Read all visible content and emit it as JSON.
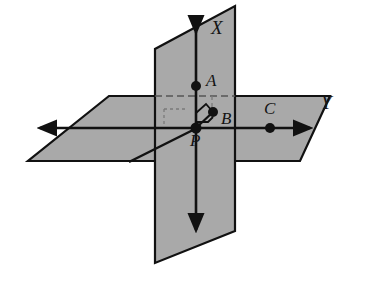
{
  "figure": {
    "background_color": "#ffffff",
    "plane_fill_color": "#a9a9a9",
    "plane_stroke_color": "#111111",
    "axis_color": "#111111",
    "point_color": "#111111",
    "dashed_color": "#6e6e6e"
  },
  "axes": [
    {
      "name": "x-axis",
      "label": "X",
      "orientation": "vertical",
      "label_position": {
        "x": 211,
        "y": 20
      },
      "arrow_start": {
        "x": 196,
        "y": 30
      },
      "arrow_end": {
        "x": 196,
        "y": 232
      },
      "double_headed": true
    },
    {
      "name": "y-axis",
      "label": "Y",
      "orientation": "horizontal",
      "label_position": {
        "x": 322,
        "y": 94
      },
      "arrow_start": {
        "x": 38,
        "y": 128
      },
      "arrow_end": {
        "x": 312,
        "y": 128
      },
      "double_headed": true
    }
  ],
  "points": [
    {
      "name": "point-a",
      "label": "A",
      "x": 196,
      "y": 86,
      "label_x": 205,
      "label_y": 74,
      "radius": 5
    },
    {
      "name": "point-b",
      "label": "B",
      "x": 212,
      "y": 112,
      "label_x": 220,
      "label_y": 111,
      "radius": 5
    },
    {
      "name": "point-c",
      "label": "C",
      "x": 270,
      "y": 128,
      "label_x": 263,
      "label_y": 96,
      "radius": 5
    },
    {
      "name": "point-p",
      "label": "P",
      "x": 196,
      "y": 128,
      "label_x": 191,
      "label_y": 133,
      "radius": 5
    }
  ],
  "planes": [
    {
      "name": "horizontal-plane",
      "points": "109,96 330,96 300,161 28,161",
      "role": "base plane containing line Y"
    },
    {
      "name": "vertical-plane",
      "points": "235,6 235,231 155,263 155,49",
      "role": "plane perpendicular to base containing line X"
    }
  ],
  "segments": [
    {
      "name": "segment-pb",
      "x1": 196,
      "y1": 128,
      "x2": 212,
      "y2": 112
    },
    {
      "name": "segment-p-diagonal",
      "x1": 196,
      "y1": 128,
      "x2": 131,
      "y2": 161
    }
  ],
  "dashed_guides": [
    {
      "name": "dashed-a-horizontal",
      "x1": 155,
      "y1": 96,
      "x2": 235,
      "y2": 96
    },
    {
      "name": "dashed-p-horizontal",
      "x1": 157,
      "y1": 128,
      "x2": 196,
      "y2": 128
    },
    {
      "name": "dashed-b-vertical",
      "x1": 212,
      "y1": 96,
      "x2": 212,
      "y2": 112
    },
    {
      "name": "dashed-small-square-top",
      "x1": 165,
      "y1": 108,
      "x2": 186,
      "y2": 108
    },
    {
      "name": "dashed-small-square-left",
      "x1": 165,
      "y1": 108,
      "x2": 165,
      "y2": 127
    },
    {
      "name": "dashed-p-below",
      "x1": 196,
      "y1": 128,
      "x2": 196,
      "y2": 150
    }
  ],
  "right_angle_marks": [
    {
      "name": "right-angle-mark-pa-pb",
      "path": "M 196,113 L 205,104 L 212,112"
    },
    {
      "name": "right-angle-mark-pb-py",
      "path": "M 196,122 L 206,122 L 206,117"
    }
  ]
}
